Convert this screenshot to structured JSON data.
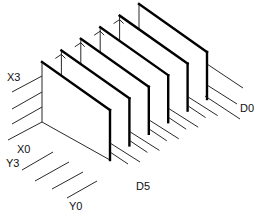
{
  "diagram": {
    "type": "isometric memory plane stack",
    "plane_count": 6,
    "labels": {
      "x_top": "X3",
      "x_bottom": "X0",
      "y_top": "Y3",
      "y_bottom": "Y0",
      "d_back": "D0",
      "d_front": "D5"
    },
    "x_lines": [
      "X0",
      "X1",
      "X2",
      "X3"
    ],
    "y_lines": [
      "Y0",
      "Y1",
      "Y2",
      "Y3"
    ],
    "planes": [
      "D0",
      "D1",
      "D2",
      "D3",
      "D4",
      "D5"
    ],
    "colors": {
      "line": "#000000",
      "background": "#ffffff"
    }
  }
}
